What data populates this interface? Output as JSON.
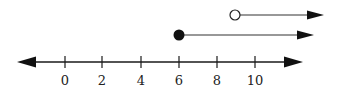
{
  "diagram": {
    "type": "number-line",
    "axis": {
      "min_shown": 0,
      "max_shown": 10,
      "tick_step": 2,
      "ticks": [
        {
          "value": 0,
          "label": "0"
        },
        {
          "value": 2,
          "label": "2"
        },
        {
          "value": 4,
          "label": "4"
        },
        {
          "value": 6,
          "label": "6"
        },
        {
          "value": 8,
          "label": "8"
        },
        {
          "value": 10,
          "label": "10"
        }
      ],
      "arrows": "both-ends"
    },
    "rays": [
      {
        "start": 9,
        "endpoint": "open-circle",
        "direction": "right",
        "meaning": "x > 9"
      },
      {
        "start": 6,
        "endpoint": "closed-circle",
        "direction": "right",
        "meaning": "x >= 6"
      }
    ],
    "colors": {
      "line": "#1a1a1a",
      "ray": "#333333",
      "background": "#ffffff"
    }
  }
}
